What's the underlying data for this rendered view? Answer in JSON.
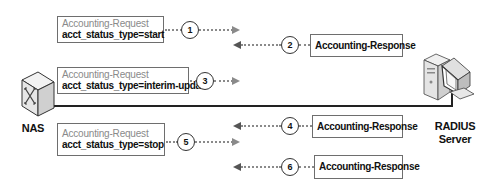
{
  "diagram": {
    "type": "sequence",
    "nodes": {
      "nas": {
        "label": "NAS",
        "icon": "network-switch-icon"
      },
      "server": {
        "label_line1": "RADIUS",
        "label_line2": "Server",
        "icon": "server-computer-icon"
      }
    },
    "messages": [
      {
        "step": "1",
        "direction": "nas-to-server",
        "title": "Accounting-Request",
        "value": "acct_status_type=start"
      },
      {
        "step": "2",
        "direction": "server-to-nas",
        "title": "Accounting-Response"
      },
      {
        "step": "3",
        "direction": "nas-to-server",
        "title": "Accounting-Request",
        "value": "acct_status_type=interim-update"
      },
      {
        "step": "4",
        "direction": "server-to-nas",
        "title": "Accounting-Response"
      },
      {
        "step": "5",
        "direction": "nas-to-server",
        "title": "Accounting-Request",
        "value": "acct_status_type=stop"
      },
      {
        "step": "6",
        "direction": "server-to-nas",
        "title": "Accounting-Response"
      }
    ],
    "colors": {
      "arrow": "#8a8a8a",
      "request_title": "#8a8a8a",
      "text": "#111111",
      "border": "#6e6e6e"
    }
  }
}
